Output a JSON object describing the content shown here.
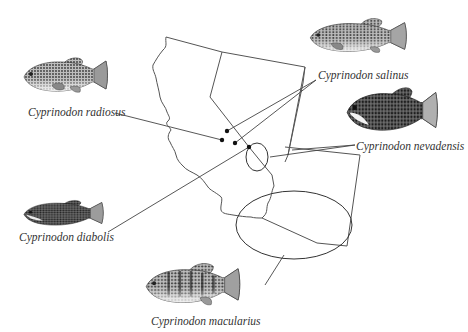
{
  "figure": {
    "species": [
      {
        "id": "radiosus",
        "label": "Cyprinodon radiosus"
      },
      {
        "id": "salinus",
        "label": "Cyprinodon salinus"
      },
      {
        "id": "nevadensis",
        "label": "Cyprinodon nevadensis"
      },
      {
        "id": "diabolis",
        "label": "Cyprinodon diabolis"
      },
      {
        "id": "macularius",
        "label": "Cyprinodon macularius"
      }
    ]
  },
  "colors": {
    "line": "#555555",
    "dot": "#111111",
    "fish_dark": "#3a3a3a",
    "fish_light": "#cfcfcf"
  }
}
